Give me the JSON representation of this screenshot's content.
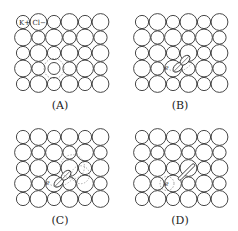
{
  "figure": {
    "grid": {
      "rows": 5,
      "cols": 6,
      "small_ion": "K+",
      "large_ion": "Cl-"
    },
    "ion_labels": {
      "cation": "K",
      "cation_charge": "+",
      "anion": "Cl",
      "anion_charge": "−"
    },
    "electron_symbol": "e",
    "panels": [
      {
        "id": "A",
        "label": "(A)",
        "state": "electron trapped in anion vacancy"
      },
      {
        "id": "B",
        "label": "(B)",
        "state": "electron adjacent to Cl2- molecule-ion"
      },
      {
        "id": "C",
        "label": "(C)",
        "state": "electron with Cl2- and displaced orbitals"
      },
      {
        "id": "D",
        "label": "(D)",
        "state": "separated electron and Cl2 bond"
      }
    ],
    "colors": {
      "stroke": "#333333",
      "dashed": "#666666"
    }
  }
}
